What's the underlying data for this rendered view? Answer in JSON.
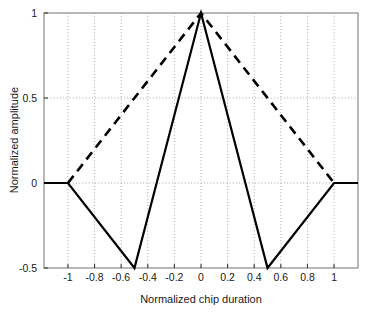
{
  "chart_data": {
    "type": "line",
    "title": "",
    "xlabel": "Normalized chip duration",
    "ylabel": "Normalized amplitude",
    "xlim": [
      -1.18,
      1.18
    ],
    "ylim": [
      -0.5,
      1.0
    ],
    "grid": true,
    "grid_style": "dotted",
    "legend": "none",
    "xticks": [
      -1,
      -0.8,
      -0.6,
      -0.4,
      -0.2,
      0,
      0.2,
      0.4,
      0.6,
      0.8,
      1
    ],
    "xticklabels": [
      "-1",
      "-0.8",
      "-0.6",
      "-0.4",
      "-0.2",
      "0",
      "0.2",
      "0.4",
      "0.6",
      "0.8",
      "1"
    ],
    "yticks": [
      -0.5,
      0,
      0.5,
      1
    ],
    "yticklabels": [
      "-0.5",
      "0",
      "0.5",
      "1"
    ],
    "series": [
      {
        "name": "solid-waveform",
        "style": "solid",
        "color": "#000000",
        "linewidth": 2.2,
        "points": [
          {
            "x": -1.18,
            "y": 0
          },
          {
            "x": -1.0,
            "y": 0
          },
          {
            "x": -0.5,
            "y": -0.5
          },
          {
            "x": 0.0,
            "y": 1.0
          },
          {
            "x": 0.5,
            "y": -0.5
          },
          {
            "x": 1.0,
            "y": 0
          },
          {
            "x": 1.18,
            "y": 0
          }
        ]
      },
      {
        "name": "dashed-waveform",
        "style": "dashed",
        "color": "#000000",
        "linewidth": 2.6,
        "points": [
          {
            "x": -1.0,
            "y": 0
          },
          {
            "x": 0.0,
            "y": 1.0
          },
          {
            "x": 1.0,
            "y": 0
          }
        ]
      }
    ]
  },
  "axes": {
    "x_label": "Normalized chip duration",
    "y_label": "Normalized amplitude",
    "x_tick_labels": [
      "-1",
      "-0.8",
      "-0.6",
      "-0.4",
      "-0.2",
      "0",
      "0.2",
      "0.4",
      "0.6",
      "0.8",
      "1"
    ],
    "y_tick_labels": [
      "1",
      "0.5",
      "0",
      "-0.5"
    ],
    "frame_color": "#8a8a8a",
    "grid_color": "#9a9a9a",
    "text_color": "#1a1a1a"
  }
}
